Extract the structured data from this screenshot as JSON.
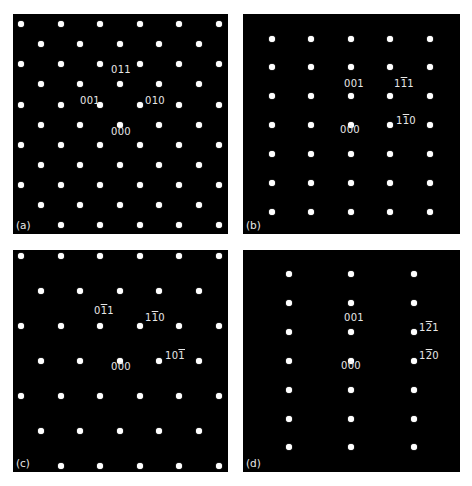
{
  "figure": {
    "background": "#ffffff",
    "panel_background": "#000000",
    "spot_color": "#ffffff",
    "label_color": "#e8e8e8",
    "panels": [
      {
        "id": "a",
        "tag": "(a)",
        "box": {
          "x": 13,
          "y": 14,
          "w": 215,
          "h": 220
        },
        "spots": [
          [
            21,
            24
          ],
          [
            61,
            24
          ],
          [
            100,
            24
          ],
          [
            140,
            24
          ],
          [
            179,
            24
          ],
          [
            219,
            24
          ],
          [
            41,
            44
          ],
          [
            80,
            44
          ],
          [
            120,
            44
          ],
          [
            159,
            44
          ],
          [
            199,
            44
          ],
          [
            21,
            64
          ],
          [
            61,
            64
          ],
          [
            100,
            64
          ],
          [
            140,
            64
          ],
          [
            179,
            64
          ],
          [
            219,
            64
          ],
          [
            41,
            84
          ],
          [
            80,
            84
          ],
          [
            120,
            84
          ],
          [
            159,
            84
          ],
          [
            199,
            84
          ],
          [
            21,
            105
          ],
          [
            61,
            105
          ],
          [
            100,
            105
          ],
          [
            140,
            105
          ],
          [
            179,
            105
          ],
          [
            219,
            105
          ],
          [
            41,
            125
          ],
          [
            80,
            125
          ],
          [
            120,
            125
          ],
          [
            159,
            125
          ],
          [
            199,
            125
          ],
          [
            21,
            145
          ],
          [
            61,
            145
          ],
          [
            100,
            145
          ],
          [
            140,
            145
          ],
          [
            179,
            145
          ],
          [
            219,
            145
          ],
          [
            41,
            165
          ],
          [
            80,
            165
          ],
          [
            120,
            165
          ],
          [
            159,
            165
          ],
          [
            199,
            165
          ],
          [
            21,
            185
          ],
          [
            61,
            185
          ],
          [
            100,
            185
          ],
          [
            140,
            185
          ],
          [
            179,
            185
          ],
          [
            219,
            185
          ],
          [
            41,
            205
          ],
          [
            80,
            205
          ],
          [
            120,
            205
          ],
          [
            159,
            205
          ],
          [
            199,
            205
          ],
          [
            61,
            225
          ],
          [
            100,
            225
          ],
          [
            140,
            225
          ],
          [
            179,
            225
          ],
          [
            219,
            225
          ]
        ],
        "labels": [
          {
            "text": "011",
            "parts": [
              [
                "0",
                false
              ],
              [
                "1",
                false
              ],
              [
                "1",
                false
              ]
            ],
            "x": 111,
            "y": 70
          },
          {
            "text": "001",
            "parts": [
              [
                "0",
                false
              ],
              [
                "0",
                false
              ],
              [
                "1",
                false
              ]
            ],
            "x": 80,
            "y": 101
          },
          {
            "text": "010",
            "parts": [
              [
                "0",
                false
              ],
              [
                "1",
                false
              ],
              [
                "0",
                false
              ]
            ],
            "x": 145,
            "y": 101
          },
          {
            "text": "000",
            "parts": [
              [
                "0",
                false
              ],
              [
                "0",
                false
              ],
              [
                "0",
                false
              ]
            ],
            "x": 111,
            "y": 132
          }
        ]
      },
      {
        "id": "b",
        "tag": "(b)",
        "box": {
          "x": 243,
          "y": 14,
          "w": 217,
          "h": 220
        },
        "spots": [
          [
            272,
            39
          ],
          [
            311,
            39
          ],
          [
            351,
            39
          ],
          [
            390,
            39
          ],
          [
            430,
            39
          ],
          [
            272,
            67
          ],
          [
            311,
            67
          ],
          [
            351,
            67
          ],
          [
            390,
            67
          ],
          [
            430,
            67
          ],
          [
            272,
            96
          ],
          [
            311,
            96
          ],
          [
            351,
            96
          ],
          [
            390,
            96
          ],
          [
            430,
            96
          ],
          [
            272,
            125
          ],
          [
            311,
            125
          ],
          [
            351,
            125
          ],
          [
            390,
            125
          ],
          [
            430,
            125
          ],
          [
            272,
            154
          ],
          [
            311,
            154
          ],
          [
            351,
            154
          ],
          [
            390,
            154
          ],
          [
            430,
            154
          ],
          [
            272,
            183
          ],
          [
            311,
            183
          ],
          [
            351,
            183
          ],
          [
            390,
            183
          ],
          [
            430,
            183
          ],
          [
            272,
            212
          ],
          [
            311,
            212
          ],
          [
            351,
            212
          ],
          [
            390,
            212
          ],
          [
            430,
            212
          ]
        ],
        "labels": [
          {
            "text": "001",
            "parts": [
              [
                "0",
                false
              ],
              [
                "0",
                false
              ],
              [
                "1",
                false
              ]
            ],
            "x": 344,
            "y": 84
          },
          {
            "text": "1-11",
            "parts": [
              [
                "1",
                false
              ],
              [
                "1",
                true
              ],
              [
                "1",
                false
              ]
            ],
            "x": 394,
            "y": 84
          },
          {
            "text": "1-10",
            "parts": [
              [
                "1",
                false
              ],
              [
                "1",
                true
              ],
              [
                "0",
                false
              ]
            ],
            "x": 396,
            "y": 121
          },
          {
            "text": "000",
            "parts": [
              [
                "0",
                false
              ],
              [
                "0",
                false
              ],
              [
                "0",
                false
              ]
            ],
            "x": 340,
            "y": 130
          }
        ]
      },
      {
        "id": "c",
        "tag": "(c)",
        "box": {
          "x": 13,
          "y": 250,
          "w": 215,
          "h": 222
        },
        "spots": [
          [
            21,
            256
          ],
          [
            61,
            256
          ],
          [
            100,
            256
          ],
          [
            140,
            256
          ],
          [
            179,
            256
          ],
          [
            219,
            256
          ],
          [
            41,
            291
          ],
          [
            80,
            291
          ],
          [
            120,
            291
          ],
          [
            159,
            291
          ],
          [
            199,
            291
          ],
          [
            21,
            326
          ],
          [
            61,
            326
          ],
          [
            100,
            326
          ],
          [
            140,
            326
          ],
          [
            179,
            326
          ],
          [
            219,
            326
          ],
          [
            41,
            361
          ],
          [
            80,
            361
          ],
          [
            120,
            361
          ],
          [
            159,
            361
          ],
          [
            199,
            361
          ],
          [
            21,
            396
          ],
          [
            61,
            396
          ],
          [
            100,
            396
          ],
          [
            140,
            396
          ],
          [
            179,
            396
          ],
          [
            219,
            396
          ],
          [
            41,
            431
          ],
          [
            80,
            431
          ],
          [
            120,
            431
          ],
          [
            159,
            431
          ],
          [
            199,
            431
          ],
          [
            61,
            466
          ],
          [
            100,
            466
          ],
          [
            140,
            466
          ],
          [
            179,
            466
          ],
          [
            219,
            466
          ]
        ],
        "labels": [
          {
            "text": "0-11",
            "parts": [
              [
                "0",
                false
              ],
              [
                "1",
                true
              ],
              [
                "1",
                false
              ]
            ],
            "x": 94,
            "y": 311
          },
          {
            "text": "1-10",
            "parts": [
              [
                "1",
                false
              ],
              [
                "1",
                true
              ],
              [
                "0",
                false
              ]
            ],
            "x": 145,
            "y": 318
          },
          {
            "text": "10-1",
            "parts": [
              [
                "1",
                false
              ],
              [
                "0",
                false
              ],
              [
                "1",
                true
              ]
            ],
            "x": 165,
            "y": 356
          },
          {
            "text": "000",
            "parts": [
              [
                "0",
                false
              ],
              [
                "0",
                false
              ],
              [
                "0",
                false
              ]
            ],
            "x": 111,
            "y": 367
          }
        ]
      },
      {
        "id": "d",
        "tag": "(d)",
        "box": {
          "x": 243,
          "y": 250,
          "w": 217,
          "h": 222
        },
        "spots": [
          [
            289,
            274
          ],
          [
            351,
            274
          ],
          [
            414,
            274
          ],
          [
            289,
            303
          ],
          [
            351,
            303
          ],
          [
            414,
            303
          ],
          [
            289,
            332
          ],
          [
            351,
            332
          ],
          [
            414,
            332
          ],
          [
            289,
            361
          ],
          [
            351,
            361
          ],
          [
            414,
            361
          ],
          [
            289,
            390
          ],
          [
            351,
            390
          ],
          [
            414,
            390
          ],
          [
            289,
            419
          ],
          [
            351,
            419
          ],
          [
            414,
            419
          ],
          [
            289,
            447
          ],
          [
            351,
            447
          ],
          [
            414,
            447
          ]
        ],
        "labels": [
          {
            "text": "001",
            "parts": [
              [
                "0",
                false
              ],
              [
                "0",
                false
              ],
              [
                "1",
                false
              ]
            ],
            "x": 344,
            "y": 318
          },
          {
            "text": "1-21",
            "parts": [
              [
                "1",
                false
              ],
              [
                "2",
                true
              ],
              [
                "1",
                false
              ]
            ],
            "x": 419,
            "y": 328
          },
          {
            "text": "1-20",
            "parts": [
              [
                "1",
                false
              ],
              [
                "2",
                true
              ],
              [
                "0",
                false
              ]
            ],
            "x": 419,
            "y": 356
          },
          {
            "text": "000",
            "parts": [
              [
                "0",
                false
              ],
              [
                "0",
                false
              ],
              [
                "0",
                false
              ]
            ],
            "x": 341,
            "y": 366
          }
        ]
      }
    ]
  }
}
